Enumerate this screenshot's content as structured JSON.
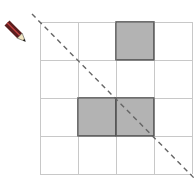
{
  "grid": {
    "rows": 4,
    "cols": 4,
    "origin_x": 40,
    "origin_y": 22,
    "cell_size": 38,
    "line_color": "#c8c8c8",
    "shaded_color": "#b3b3b3",
    "shaded_border": "#555555",
    "shaded_cells": [
      [
        0,
        2
      ],
      [
        2,
        1
      ],
      [
        2,
        2
      ]
    ]
  },
  "diagonal": {
    "x1": 32,
    "y1": 14,
    "x2": 196,
    "y2": 180,
    "color": "#666666",
    "dash": "5,4"
  },
  "icon": {
    "name": "pencil-icon",
    "body_color": "#5a1e1e",
    "tip_color": "#f2e6c2"
  }
}
